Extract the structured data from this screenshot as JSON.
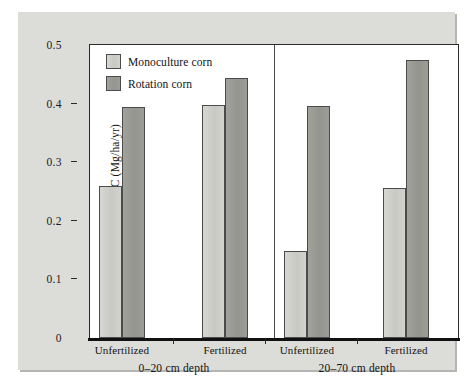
{
  "chart_data": {
    "type": "bar",
    "title": "",
    "xlabel": "",
    "ylabel": "Maize-derived C (Mg/ha/yr)",
    "ylim": [
      0,
      0.5
    ],
    "ytick_labels": [
      "0",
      "0.1",
      "0.2",
      "0.3",
      "0.4",
      "0.5"
    ],
    "ytick_values": [
      0,
      0.1,
      0.2,
      0.3,
      0.4,
      0.5
    ],
    "grid": false,
    "legend_position": "top-left inside plot",
    "categories": [
      "Unfertilized",
      "Fertilized",
      "Unfertilized",
      "Fertilized"
    ],
    "panels": [
      {
        "label": "0–20 cm depth",
        "categories": [
          "Unfertilized",
          "Fertilized"
        ]
      },
      {
        "label": "20–70 cm depth",
        "categories": [
          "Unfertilized",
          "Fertilized"
        ]
      }
    ],
    "series": [
      {
        "name": "Monoculture corn",
        "color": "#cfcfcb",
        "values": [
          0.26,
          0.398,
          0.148,
          0.256
        ]
      },
      {
        "name": "Rotation corn",
        "color": "#9a9a96",
        "values": [
          0.395,
          0.443,
          0.396,
          0.474
        ]
      }
    ],
    "groups": [
      {
        "panel": "0–20 cm depth",
        "category": "Unfertilized",
        "monoculture_corn": 0.26,
        "rotation_corn": 0.395
      },
      {
        "panel": "0–20 cm depth",
        "category": "Fertilized",
        "monoculture_corn": 0.398,
        "rotation_corn": 0.443
      },
      {
        "panel": "20–70 cm depth",
        "category": "Unfertilized",
        "monoculture_corn": 0.148,
        "rotation_corn": 0.396
      },
      {
        "panel": "20–70 cm depth",
        "category": "Fertilized",
        "monoculture_corn": 0.256,
        "rotation_corn": 0.474
      }
    ]
  },
  "legend": {
    "items": [
      {
        "label": "Monoculture corn",
        "swatch": "mono"
      },
      {
        "label": "Rotation corn",
        "swatch": "rot"
      }
    ]
  },
  "axis": {
    "y_title": "Maize-derived C (Mg/ha/yr)",
    "y_ticks": [
      "0.5",
      "0.4",
      "0.3",
      "0.2",
      "0.1",
      "0"
    ],
    "x_group_labels": [
      "Unfertilized",
      "Fertilized",
      "Unfertilized",
      "Fertilized"
    ],
    "x_panel_labels": [
      "0–20 cm depth",
      "20–70 cm depth"
    ]
  },
  "colors": {
    "monoculture": "#cfcfcb",
    "rotation": "#9a9a96",
    "plate": "#dcdcd8",
    "plot_background": "#ffffff",
    "axis_line": "#111111"
  }
}
